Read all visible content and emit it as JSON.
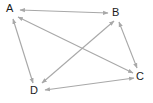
{
  "figure": {
    "kind": "directed-graph-diagram",
    "width": 153,
    "height": 103,
    "background_color": "#ffffff",
    "edge_color": "#a8a8a8",
    "label_color": "#1a1a1a"
  },
  "nodes": [
    {
      "id": "A",
      "label": "A",
      "x": 10,
      "y": 9
    },
    {
      "id": "B",
      "label": "B",
      "x": 116,
      "y": 13
    },
    {
      "id": "C",
      "label": "C",
      "x": 140,
      "y": 77
    },
    {
      "id": "D",
      "label": "D",
      "x": 34,
      "y": 91
    }
  ],
  "edges": [
    {
      "id": "edge-a-b",
      "from": "A",
      "to": "B",
      "direction": "both",
      "arrowheads": 2
    },
    {
      "id": "edge-a-d",
      "from": "A",
      "to": "D",
      "direction": "both",
      "arrowheads": 2
    },
    {
      "id": "edge-a-c",
      "from": "A",
      "to": "C",
      "direction": "both",
      "arrowheads": 2
    },
    {
      "id": "edge-b-c",
      "from": "B",
      "to": "C",
      "direction": "both",
      "arrowheads": 2
    },
    {
      "id": "edge-b-d",
      "from": "B",
      "to": "D",
      "direction": "both",
      "arrowheads": 2
    },
    {
      "id": "edge-c-d",
      "from": "C",
      "to": "D",
      "direction": "both",
      "arrowheads": 2
    }
  ],
  "geometry": {
    "edge_a_b": {
      "x1": 20,
      "y1": 10,
      "x2": 108,
      "y2": 13
    },
    "edge_a_d": {
      "x1": 13,
      "y1": 19,
      "x2": 33,
      "y2": 83
    },
    "edge_a_c": {
      "x1": 18,
      "y1": 17,
      "x2": 133,
      "y2": 73
    },
    "edge_b_c": {
      "x1": 119,
      "y1": 22,
      "x2": 137,
      "y2": 68
    },
    "edge_b_d": {
      "x1": 114,
      "y1": 21,
      "x2": 42,
      "y2": 83
    },
    "edge_c_d": {
      "x1": 134,
      "y1": 78,
      "x2": 45,
      "y2": 90
    }
  }
}
